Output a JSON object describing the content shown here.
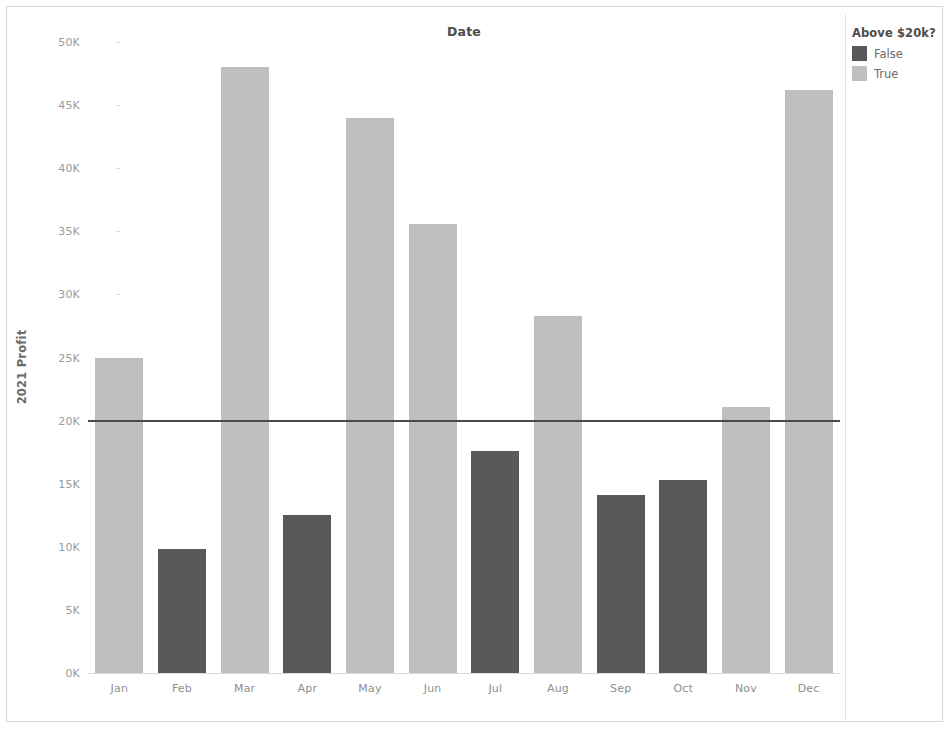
{
  "chart_data": {
    "type": "bar",
    "title": "Date",
    "xlabel": "",
    "ylabel": "2021 Profit",
    "categories": [
      "Jan",
      "Feb",
      "Mar",
      "Apr",
      "May",
      "Jun",
      "Jul",
      "Aug",
      "Sep",
      "Oct",
      "Nov",
      "Dec"
    ],
    "values": [
      25000,
      9800,
      48000,
      12500,
      44000,
      35600,
      17600,
      28300,
      14100,
      15300,
      21100,
      46200
    ],
    "point_colors": [
      "True",
      "False",
      "True",
      "False",
      "True",
      "True",
      "False",
      "True",
      "False",
      "False",
      "True",
      "True"
    ],
    "ylim": [
      0,
      50000
    ],
    "ytick_values": [
      0,
      5000,
      10000,
      15000,
      20000,
      25000,
      30000,
      35000,
      40000,
      45000,
      50000
    ],
    "ytick_labels": [
      "0K",
      "5K",
      "10K",
      "15K",
      "20K",
      "25K",
      "30K",
      "35K",
      "40K",
      "45K",
      "50K"
    ],
    "grid": false,
    "legend_position": "right",
    "reference_line": {
      "value": 20000,
      "label": "",
      "color": "#4a4a4a"
    }
  },
  "legend": {
    "title": "Above $20k?",
    "items": [
      {
        "label": "False",
        "color": "#595959"
      },
      {
        "label": "True",
        "color": "#bfbfbf"
      }
    ]
  },
  "colors": {
    "false_bar": "#595959",
    "true_bar": "#bfbfbf",
    "axis_text": "#9b9b9b",
    "title_text": "#4c4c4c",
    "reference_line": "#4a4a4a",
    "frame": "#d4d4d4"
  }
}
